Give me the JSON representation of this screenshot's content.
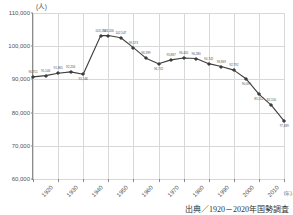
{
  "axis": {
    "y_unit": "(人)",
    "x_unit": "(年)",
    "y_ticks": [
      "110,000",
      "100,000",
      "90,000",
      "80,000",
      "70,000",
      "60,000"
    ],
    "x_ticks": [
      "1920",
      "1930",
      "1940",
      "1950",
      "1960",
      "1970",
      "1980",
      "1990",
      "2000",
      "2010",
      "2020"
    ]
  },
  "caption": "出典／1920－2020年国勢調査",
  "style": {
    "line_color": "#3d3d3d",
    "grid_color": "#d8d8d8",
    "axis_color": "#8a8a8a",
    "label_color": "#5a5a5a",
    "background": "#ffffff"
  },
  "chart_data": {
    "type": "line",
    "title": "",
    "xlabel": "(年)",
    "ylabel": "(人)",
    "ylim": [
      60000,
      110000
    ],
    "xlim": [
      1920,
      2020
    ],
    "grid": true,
    "legend": false,
    "series_name": "国勢調査人口",
    "x": [
      1920,
      1925,
      1930,
      1935,
      1940,
      1947,
      1950,
      1955,
      1960,
      1965,
      1970,
      1975,
      1980,
      1985,
      1990,
      1995,
      2000,
      2005,
      2010,
      2015,
      2020
    ],
    "values": [
      90751,
      91146,
      91865,
      92256,
      91546,
      103194,
      103206,
      102547,
      99573,
      96399,
      94732,
      95887,
      96445,
      96280,
      94742,
      93869,
      92792,
      90099,
      85552,
      82150,
      77489
    ],
    "point_labels": [
      "90,751",
      "91,146",
      "91,865",
      "92,256",
      "91,546",
      "103,194",
      "103,206",
      "102,547",
      "99,573",
      "96,399",
      "94,732",
      "95,887",
      "96,445",
      "96,280",
      "94,742",
      "93,869",
      "92,792",
      "90,099",
      "85,552",
      "82,150",
      "77,489"
    ],
    "label_positions": [
      "above",
      "above",
      "above",
      "above",
      "below",
      "above",
      "above",
      "above",
      "above",
      "above",
      "below",
      "above",
      "above",
      "above",
      "above",
      "above",
      "above",
      "below",
      "below",
      "above",
      "below"
    ]
  }
}
